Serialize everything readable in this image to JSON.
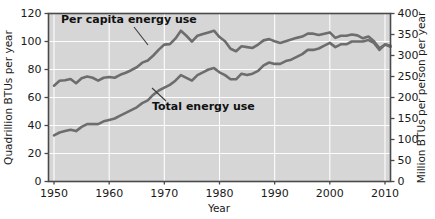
{
  "chart_data": {
    "type": "line",
    "title": "",
    "xlabel": "Year",
    "ylabel": "Quadrillion BTUs per year",
    "y2label": "Million BTUs per person per year",
    "xlim": [
      1949,
      2011
    ],
    "ylim": [
      0,
      120
    ],
    "y2lim": [
      0,
      400
    ],
    "grid": true,
    "legend_position": "inline-annotations",
    "xticks": [
      1950,
      1960,
      1970,
      1980,
      1990,
      2000,
      2010
    ],
    "xticklabels": [
      "1950",
      "1960",
      "1970",
      "1980",
      "1990",
      "2000",
      "2010"
    ],
    "yticks": [
      0,
      20,
      40,
      60,
      80,
      100,
      120
    ],
    "yticklabels": [
      "0",
      "20",
      "40",
      "60",
      "80",
      "100",
      "120"
    ],
    "y2ticks": [
      0,
      50,
      100,
      150,
      200,
      250,
      300,
      350,
      400
    ],
    "y2ticklabels": [
      "0",
      "50",
      "100",
      "150",
      "200",
      "250",
      "300",
      "350",
      "400"
    ],
    "series": [
      {
        "name": "Per capita energy use",
        "axis": "right",
        "units": "Million BTUs per person per year",
        "color": "#6d6d6d",
        "x": [
          1950,
          1951,
          1952,
          1953,
          1954,
          1955,
          1956,
          1957,
          1958,
          1959,
          1960,
          1961,
          1962,
          1963,
          1964,
          1965,
          1966,
          1967,
          1968,
          1969,
          1970,
          1971,
          1972,
          1973,
          1974,
          1975,
          1976,
          1977,
          1978,
          1979,
          1980,
          1981,
          1982,
          1983,
          1984,
          1985,
          1986,
          1987,
          1988,
          1989,
          1990,
          1991,
          1992,
          1993,
          1994,
          1995,
          1996,
          1997,
          1998,
          1999,
          2000,
          2001,
          2002,
          2003,
          2004,
          2005,
          2006,
          2007,
          2008,
          2009,
          2010,
          2011
        ],
        "values": [
          228,
          240,
          241,
          244,
          234,
          246,
          250,
          247,
          240,
          247,
          249,
          247,
          254,
          259,
          265,
          272,
          283,
          288,
          300,
          314,
          326,
          327,
          340,
          359,
          347,
          333,
          347,
          351,
          355,
          359,
          344,
          334,
          316,
          310,
          322,
          320,
          318,
          326,
          336,
          339,
          334,
          330,
          334,
          338,
          342,
          345,
          352,
          352,
          349,
          352,
          355,
          342,
          347,
          347,
          350,
          348,
          341,
          345,
          334,
          317,
          326,
          321
        ]
      },
      {
        "name": "Total energy use",
        "axis": "left",
        "units": "Quadrillion BTUs per year",
        "color": "#6d6d6d",
        "x": [
          1950,
          1951,
          1952,
          1953,
          1954,
          1955,
          1956,
          1957,
          1958,
          1959,
          1960,
          1961,
          1962,
          1963,
          1964,
          1965,
          1966,
          1967,
          1968,
          1969,
          1970,
          1971,
          1972,
          1973,
          1974,
          1975,
          1976,
          1977,
          1978,
          1979,
          1980,
          1981,
          1982,
          1983,
          1984,
          1985,
          1986,
          1987,
          1988,
          1989,
          1990,
          1991,
          1992,
          1993,
          1994,
          1995,
          1996,
          1997,
          1998,
          1999,
          2000,
          2001,
          2002,
          2003,
          2004,
          2005,
          2006,
          2007,
          2008,
          2009,
          2010,
          2011
        ],
        "values": [
          33,
          35,
          36,
          37,
          36,
          39,
          41,
          41,
          41,
          43,
          44,
          45,
          47,
          49,
          51,
          53,
          56,
          58,
          62,
          65,
          67,
          69,
          72,
          76,
          74,
          72,
          76,
          78,
          80,
          81,
          78,
          76,
          73,
          73,
          77,
          76,
          77,
          79,
          83,
          85,
          84,
          84,
          86,
          87,
          89,
          91,
          94,
          94,
          95,
          97,
          99,
          96,
          98,
          98,
          100,
          100,
          100,
          101,
          99,
          94,
          98,
          97
        ]
      }
    ],
    "annotations": [
      {
        "text": "Per capita energy use",
        "target_series": "Per capita energy use",
        "leader": true
      },
      {
        "text": "Total energy use",
        "target_series": "Total energy use",
        "leader": true
      }
    ],
    "style": {
      "panel_background": "#d6d6d6",
      "gridline_color": "#fdfdfd",
      "frame_color": "#4a4a4a",
      "line_color": "#6d6d6d",
      "page_background": "#ffffff"
    }
  }
}
